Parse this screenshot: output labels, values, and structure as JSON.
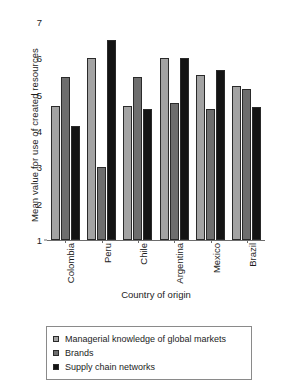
{
  "chart_data": {
    "type": "bar",
    "title": "",
    "xlabel": "Country of origin",
    "ylabel": "Mean value for use of created resources",
    "categories": [
      "Colombia",
      "Peru",
      "Chile",
      "Argentina",
      "Mexico",
      "Brazil"
    ],
    "yticks": [
      1,
      2,
      3,
      4,
      5,
      6,
      7
    ],
    "ylim": [
      1,
      7
    ],
    "grid": false,
    "legend_position": "bottom",
    "series": [
      {
        "name": "Managerial knowledge of global markets",
        "color": "#a3a3a3",
        "values": [
          4.68,
          6.0,
          4.68,
          6.0,
          5.55,
          5.25
        ]
      },
      {
        "name": "Brands",
        "color": "#6e6e6e",
        "values": [
          5.5,
          3.0,
          5.5,
          4.78,
          4.6,
          5.15
        ]
      },
      {
        "name": "Supply chain networks",
        "color": "#141414",
        "values": [
          4.15,
          6.5,
          4.6,
          6.0,
          5.68,
          4.65
        ]
      }
    ]
  },
  "axis": {
    "y_title": "Mean value for use of created resources",
    "x_title": "Country of origin",
    "tick_labels_y": [
      "7",
      "6",
      "5",
      "4",
      "3",
      "2",
      "1"
    ],
    "tick_labels_x": [
      "Colombia",
      "Peru",
      "Chile",
      "Argentina",
      "Mexico",
      "Brazil"
    ]
  },
  "legend": {
    "items": [
      {
        "label": "Managerial knowledge of global markets",
        "color": "#a3a3a3"
      },
      {
        "label": "Brands",
        "color": "#6e6e6e"
      },
      {
        "label": "Supply chain networks",
        "color": "#141414"
      }
    ]
  }
}
